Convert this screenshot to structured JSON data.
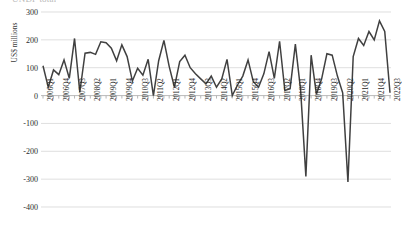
{
  "chart_title": "UNDP total",
  "y_axis_title": "US$ millions",
  "chart_data": {
    "type": "line",
    "title": "UNDP total",
    "xlabel": "",
    "ylabel": "US$ millions",
    "ylim": [
      -400,
      300
    ],
    "yticks": [
      300,
      200,
      100,
      0,
      -100,
      -200,
      -300,
      -400
    ],
    "grid": true,
    "legend": false,
    "line_color": "#404040",
    "x_tick_labels": [
      "2006Q1",
      "2006Q4",
      "2007Q3",
      "2008Q2",
      "2009Q1",
      "2009Q4",
      "2010Q3",
      "2011Q2",
      "2012Q1",
      "2012Q4",
      "2013Q3",
      "2014Q2",
      "2015Q1",
      "2015Q4",
      "2016Q3",
      "2017Q2",
      "2018Q1",
      "2018Q4",
      "2019Q3",
      "2020Q2",
      "2021Q1",
      "2021Q4",
      "2022Q3"
    ],
    "x_tick_step": 3,
    "categories": [
      "2006Q1",
      "2006Q2",
      "2006Q3",
      "2006Q4",
      "2007Q1",
      "2007Q2",
      "2007Q3",
      "2007Q4",
      "2008Q1",
      "2008Q2",
      "2008Q3",
      "2008Q4",
      "2009Q1",
      "2009Q2",
      "2009Q3",
      "2009Q4",
      "2010Q1",
      "2010Q2",
      "2010Q3",
      "2010Q4",
      "2011Q1",
      "2011Q2",
      "2011Q3",
      "2011Q4",
      "2012Q1",
      "2012Q2",
      "2012Q3",
      "2012Q4",
      "2013Q1",
      "2013Q2",
      "2013Q3",
      "2013Q4",
      "2014Q1",
      "2014Q2",
      "2014Q3",
      "2014Q4",
      "2015Q1",
      "2015Q2",
      "2015Q3",
      "2015Q4",
      "2016Q1",
      "2016Q2",
      "2016Q3",
      "2016Q4",
      "2017Q1",
      "2017Q2",
      "2017Q3",
      "2017Q4",
      "2018Q1",
      "2018Q2",
      "2018Q3",
      "2018Q4",
      "2019Q1",
      "2019Q2",
      "2019Q3",
      "2019Q4",
      "2020Q1",
      "2020Q2",
      "2020Q3",
      "2020Q4",
      "2021Q1",
      "2021Q2",
      "2021Q3",
      "2021Q4",
      "2022Q1",
      "2022Q2",
      "2022Q3"
    ],
    "values": [
      107,
      30,
      92,
      75,
      128,
      62,
      205,
      12,
      152,
      155,
      148,
      193,
      190,
      170,
      125,
      182,
      140,
      52,
      98,
      73,
      130,
      0,
      125,
      198,
      105,
      30,
      122,
      145,
      100,
      78,
      60,
      42,
      70,
      30,
      60,
      130,
      0,
      38,
      70,
      128,
      50,
      30,
      78,
      158,
      62,
      195,
      18,
      25,
      185,
      20,
      -290,
      145,
      5,
      60,
      150,
      145,
      70,
      10,
      -310,
      140,
      205,
      180,
      230,
      200,
      268,
      230,
      10
    ]
  }
}
